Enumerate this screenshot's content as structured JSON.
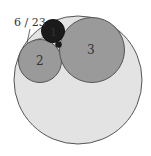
{
  "diagram": {
    "type": "tangent-circles",
    "outer_circle": {
      "cx": 78,
      "cy": 80,
      "r": 64,
      "fill": "#e3e3e3",
      "stroke": "#555555"
    },
    "circles": [
      {
        "id": "1",
        "label": "1",
        "cx": 53,
        "cy": 31,
        "r": 11.5,
        "fill": "#1a1a1a",
        "stroke": "#111111"
      },
      {
        "id": "2",
        "label": "2",
        "cx": 40,
        "cy": 61,
        "r": 21.5,
        "fill": "#9a9a9a",
        "stroke": "#555555"
      },
      {
        "id": "3",
        "label": "3",
        "cx": 92,
        "cy": 50,
        "r": 32.5,
        "fill": "#9a9a9a",
        "stroke": "#555555"
      },
      {
        "id": "small",
        "label": "",
        "cx": 58.5,
        "cy": 44.5,
        "r": 3,
        "fill": "#1a1a1a",
        "stroke": "#111111"
      }
    ],
    "annotation": {
      "text": "6 / 23",
      "x": 14,
      "y": 26,
      "leader": {
        "x1": 30,
        "y1": 29,
        "x2": 27,
        "y2": 43
      }
    },
    "lens_region": {
      "fill": "#cfcfcf"
    }
  }
}
